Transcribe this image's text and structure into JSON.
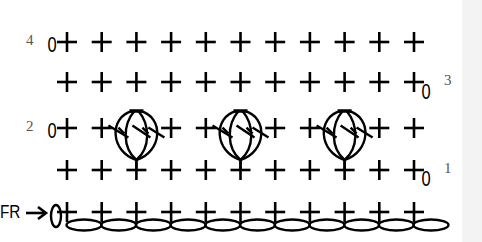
{
  "diagram": {
    "type": "crochet-stitch-chart",
    "columns": 11,
    "start_label": "FR",
    "start_arrow": "right-arrow-icon",
    "turning_chain_symbol": "0",
    "stitch_symbols": {
      "sc": "+",
      "ch": "oval",
      "cluster": "bobble-cluster"
    },
    "rows": [
      {
        "label": "4",
        "side": "left",
        "stitches": [
          "sc",
          "sc",
          "sc",
          "sc",
          "sc",
          "sc",
          "sc",
          "sc",
          "sc",
          "sc",
          "sc"
        ]
      },
      {
        "label": "3",
        "side": "right",
        "stitches": [
          "sc",
          "sc",
          "sc",
          "sc",
          "sc",
          "sc",
          "sc",
          "sc",
          "sc",
          "sc",
          "sc"
        ]
      },
      {
        "label": "2",
        "side": "left",
        "stitches": [
          "sc",
          "sc",
          "cluster",
          "sc",
          "sc",
          "cluster",
          "sc",
          "sc",
          "cluster",
          "sc",
          "sc"
        ]
      },
      {
        "label": "1",
        "side": "right",
        "stitches": [
          "sc",
          "sc",
          "sc",
          "sc",
          "sc",
          "sc",
          "sc",
          "sc",
          "sc",
          "sc",
          "sc"
        ]
      },
      {
        "label": "",
        "side": "left",
        "stitches": [
          "sc",
          "sc",
          "sc",
          "sc",
          "sc",
          "sc",
          "sc",
          "sc",
          "sc",
          "sc",
          "sc"
        ]
      }
    ],
    "foundation_chain_count": 11,
    "colors": {
      "ink": "#000000",
      "label": "#555555",
      "panel": "#f3f3f3"
    }
  },
  "labels": {
    "row4": "4",
    "row3": "3",
    "row2": "2",
    "row1": "1",
    "fr": "FR",
    "ch0": "0"
  }
}
